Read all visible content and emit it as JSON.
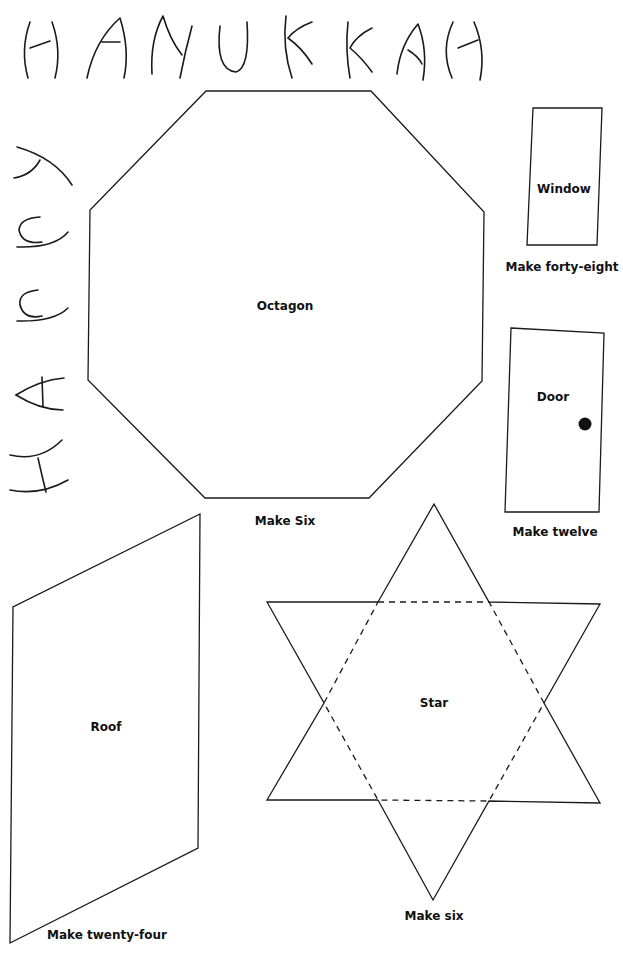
{
  "banner": {
    "top_word": "HANUKKAH",
    "side_word": "HAPPY"
  },
  "pieces": {
    "octagon": {
      "label": "Octagon",
      "instruction": "Make Six"
    },
    "window": {
      "label": "Window",
      "instruction": "Make forty-eight"
    },
    "door": {
      "label": "Door",
      "instruction": "Make twelve"
    },
    "roof": {
      "label": "Roof",
      "instruction": "Make twenty-four"
    },
    "star": {
      "label": "Star",
      "instruction": "Make six"
    }
  },
  "colors": {
    "line": "#1a1a1a",
    "background": "#ffffff"
  }
}
